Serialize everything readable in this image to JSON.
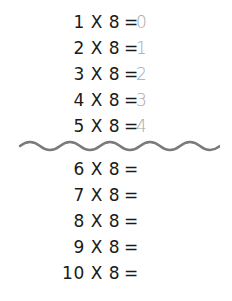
{
  "worksheet": {
    "title": "8 times table",
    "answered": [
      {
        "expr": "1 X 8",
        "eq": "=",
        "answer": "0"
      },
      {
        "expr": "2 X 8",
        "eq": "=",
        "answer": "1"
      },
      {
        "expr": "3 X 8",
        "eq": "=",
        "answer": "2"
      },
      {
        "expr": "4 X 8",
        "eq": "=",
        "answer": "3"
      },
      {
        "expr": "5 X 8",
        "eq": "=",
        "answer": "4"
      }
    ],
    "unanswered": [
      {
        "expr": "6 X 8",
        "eq": "="
      },
      {
        "expr": "7 X 8",
        "eq": "="
      },
      {
        "expr": "8 X 8",
        "eq": "="
      },
      {
        "expr": "9 X 8",
        "eq": "="
      },
      {
        "expr": "10 X 8",
        "eq": "="
      }
    ],
    "colors": {
      "text": "#1a1a1a",
      "answer": "#a8a8a8",
      "divider": "#7a7a7a"
    }
  }
}
